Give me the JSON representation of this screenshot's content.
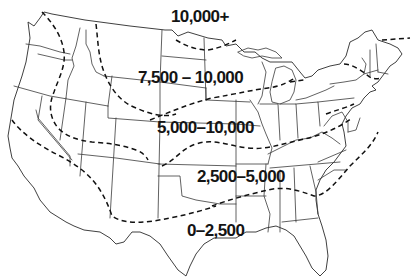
{
  "map": {
    "region": "Contiguous United States",
    "line_style": "dashed contour lines separating zones",
    "colors": {
      "background": "#ffffff",
      "state_borders": "#3a3a3a",
      "contours": "#111111",
      "labels": "#141414"
    },
    "zones": [
      {
        "id": "zone-1",
        "label": "10,000+"
      },
      {
        "id": "zone-2",
        "label": "7,500 – 10,000"
      },
      {
        "id": "zone-3",
        "label": "5,000–10,000"
      },
      {
        "id": "zone-4",
        "label": "2,500–5,000"
      },
      {
        "id": "zone-5",
        "label": "0–2,500"
      }
    ]
  }
}
